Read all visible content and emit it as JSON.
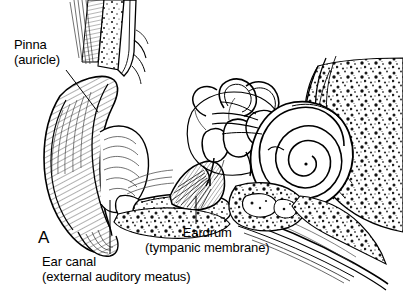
{
  "figure": {
    "panel_letter": "A",
    "background_color": "#ffffff",
    "ink_color": "#000000"
  },
  "labels": [
    {
      "id": "pinna",
      "name": "pinna-label",
      "line1": "Pinna",
      "line2": "(auricle)",
      "leader": "from text down-right to the outer ear cartilage"
    },
    {
      "id": "eardrum",
      "name": "eardrum-label",
      "line1": "Eardrum",
      "line2": "(tympanic membrane)",
      "leader": "vertical line up to the tympanic membrane"
    },
    {
      "id": "ear_canal",
      "name": "ear-canal-label",
      "line1": "Ear canal",
      "line2": "(external auditory meatus)",
      "leader": "vertical line up into the external auditory canal"
    }
  ],
  "structures": [
    "pinna",
    "ear canal",
    "eardrum",
    "ossicles",
    "semicircular canals",
    "cochlea",
    "eustachian tube",
    "temporal bone"
  ]
}
